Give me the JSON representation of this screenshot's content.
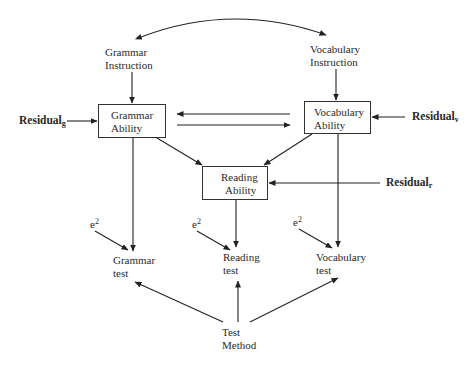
{
  "diagram": {
    "type": "path-model",
    "nodes": {
      "grammar_instruction": {
        "line1": "Grammar",
        "line2": "Instruction"
      },
      "vocabulary_instruction": {
        "line1": "Vocabulary",
        "line2": "Instruction"
      },
      "grammar_ability": {
        "line1": "Grammar",
        "line2": "Ability"
      },
      "vocabulary_ability": {
        "line1": "Vocabulary",
        "line2": "Ability"
      },
      "reading_ability": {
        "line1": "Reading",
        "line2": "Ability"
      },
      "grammar_test": {
        "line1": "Grammar",
        "line2": "test"
      },
      "reading_test": {
        "line1": "Reading",
        "line2": "test"
      },
      "vocabulary_test": {
        "line1": "Vocabulary",
        "line2": "test"
      },
      "test_method": {
        "line1": "Test",
        "line2": "Method"
      }
    },
    "residuals": {
      "grammar": {
        "base": "Residual",
        "sub": "g"
      },
      "vocabulary": {
        "base": "Residual",
        "sub": "v"
      },
      "reading": {
        "base": "Residual",
        "sub": "r"
      }
    },
    "errors": {
      "grammar": {
        "base": "e",
        "sup": "2"
      },
      "reading": {
        "base": "e",
        "sup": "2"
      },
      "vocabulary": {
        "base": "e",
        "sup": "2"
      }
    },
    "edges": [
      {
        "from": "grammar_instruction",
        "to": "vocabulary_instruction",
        "type": "bidirectional-curve"
      },
      {
        "from": "grammar_instruction",
        "to": "grammar_ability"
      },
      {
        "from": "vocabulary_instruction",
        "to": "vocabulary_ability"
      },
      {
        "from": "vocabulary_ability",
        "to": "grammar_ability"
      },
      {
        "from": "grammar_ability",
        "to": "vocabulary_ability"
      },
      {
        "from": "grammar_ability",
        "to": "reading_ability"
      },
      {
        "from": "vocabulary_ability",
        "to": "reading_ability"
      },
      {
        "from": "residual_g",
        "to": "grammar_ability"
      },
      {
        "from": "residual_v",
        "to": "vocabulary_ability"
      },
      {
        "from": "residual_r",
        "to": "reading_ability"
      },
      {
        "from": "grammar_ability",
        "to": "grammar_test"
      },
      {
        "from": "reading_ability",
        "to": "reading_test"
      },
      {
        "from": "vocabulary_ability",
        "to": "vocabulary_test"
      },
      {
        "from": "e2_grammar",
        "to": "grammar_test"
      },
      {
        "from": "e2_reading",
        "to": "reading_test"
      },
      {
        "from": "e2_vocabulary",
        "to": "vocabulary_test"
      },
      {
        "from": "test_method",
        "to": "grammar_test"
      },
      {
        "from": "test_method",
        "to": "reading_test"
      },
      {
        "from": "test_method",
        "to": "vocabulary_test"
      }
    ]
  }
}
